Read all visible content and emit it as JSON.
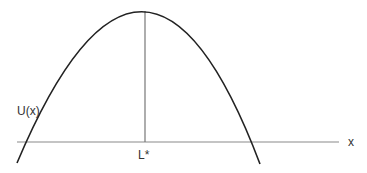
{
  "diagram": {
    "curve_label": "U(x)",
    "x_axis_label": "x",
    "optimum_label": "L*",
    "colors": {
      "curve": "#222222",
      "axis": "#888888",
      "line": "#666666"
    }
  }
}
